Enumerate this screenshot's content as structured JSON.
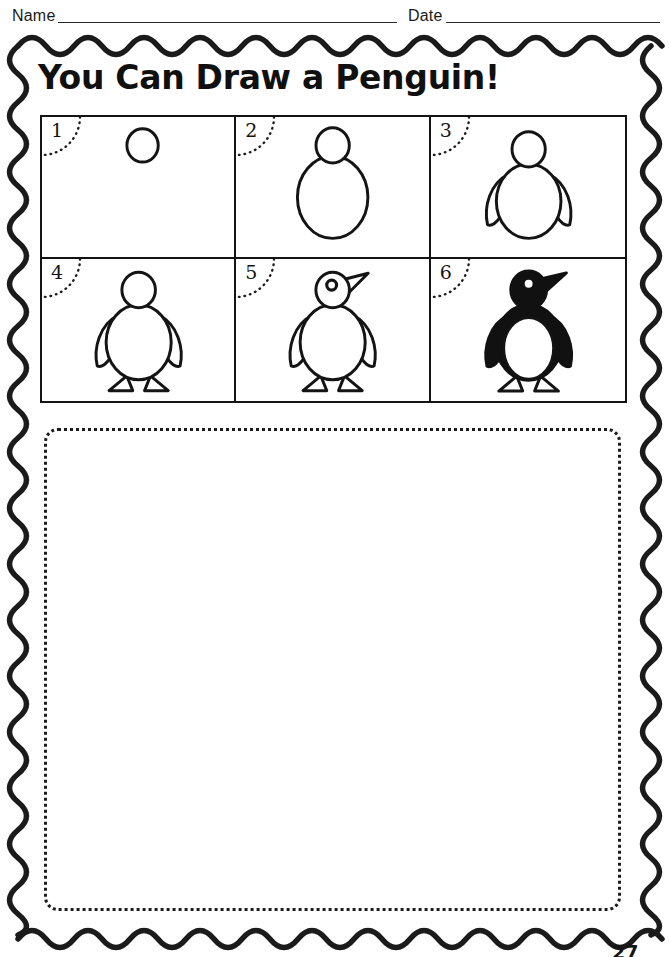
{
  "header": {
    "name_label": "Name",
    "date_label": "Date"
  },
  "title": "You Can Draw a Penguin!",
  "steps": [
    {
      "number": "1",
      "description": "Draw a small circle for the head."
    },
    {
      "number": "2",
      "description": "Add a large oval below for the body."
    },
    {
      "number": "3",
      "description": "Add two curved wings on the sides."
    },
    {
      "number": "4",
      "description": "Add two triangle feet at the bottom."
    },
    {
      "number": "5",
      "description": "Add an eye and a pointed beak."
    },
    {
      "number": "6",
      "description": "Color the penguin black, leave the belly white."
    }
  ],
  "drawing_area": {
    "label": "Draw your penguin here"
  },
  "page_number": "27",
  "colors": {
    "ink": "#141414",
    "paper": "#ffffff",
    "fill_black": "#111111"
  }
}
